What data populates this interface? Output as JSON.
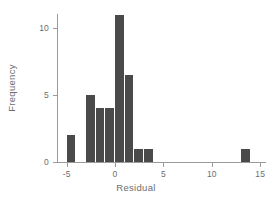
{
  "chart_data": {
    "type": "bar",
    "title": "",
    "subtitle": "",
    "xlabel": "Residual",
    "ylabel": "Frequency",
    "xlim": [
      -6,
      15.6
    ],
    "ylim": [
      0,
      11.6
    ],
    "grid": false,
    "legend": null,
    "bin_width": 1,
    "bar_color": "#4a4a4a",
    "axis_color": "#9b9b9b",
    "text_color": "#6e6e6e",
    "xticks": [
      -5,
      0,
      5,
      10,
      15
    ],
    "xtick_labels": [
      "-5",
      "0",
      "5",
      "10",
      "15"
    ],
    "yticks": [
      0,
      5,
      10
    ],
    "ytick_labels": [
      "0",
      "5",
      "10"
    ],
    "bins": [
      {
        "x0": -5,
        "x1": -4,
        "value": 2
      },
      {
        "x0": -3,
        "x1": -2,
        "value": 5
      },
      {
        "x0": -2,
        "x1": -1,
        "value": 4
      },
      {
        "x0": -1,
        "x1": 0,
        "value": 4
      },
      {
        "x0": 0,
        "x1": 1,
        "value": 11
      },
      {
        "x0": 1,
        "x1": 2,
        "value": 6.5
      },
      {
        "x0": 2,
        "x1": 3,
        "value": 1
      },
      {
        "x0": 3,
        "x1": 4,
        "value": 1
      },
      {
        "x0": 13,
        "x1": 14,
        "value": 1
      }
    ],
    "categories": [
      "-5",
      "-3",
      "-2",
      "-1",
      "0",
      "1",
      "2",
      "3",
      "13"
    ],
    "values": [
      2,
      5,
      4,
      4,
      11,
      6.5,
      1,
      1,
      1
    ]
  }
}
